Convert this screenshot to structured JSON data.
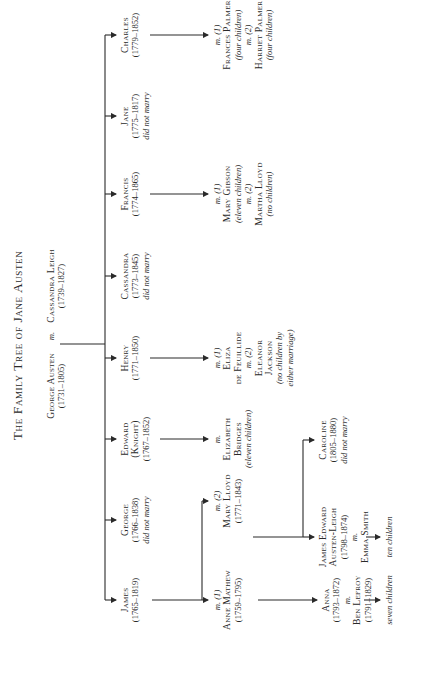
{
  "title": "The Family Tree of Jane Austen",
  "parents": {
    "father": {
      "name": "George Austen",
      "dates": "(1731–1805)"
    },
    "marriage": "m.",
    "mother": {
      "name": "Cassandra Leigh",
      "dates": "(1739–1827)"
    }
  },
  "children": [
    {
      "name": "James",
      "dates": "(1765–1819)"
    },
    {
      "name": "George",
      "dates": "(1766–1838)",
      "note": "did not marry"
    },
    {
      "name": "Edward",
      "name2": "(Knight)",
      "dates": "(1767–1852)"
    },
    {
      "name": "Henry",
      "dates": "(1771–1850)"
    },
    {
      "name": "Cassandra",
      "dates": "(1773–1845)",
      "note": "did not marry"
    },
    {
      "name": "Francis",
      "dates": "(1774–1865)"
    },
    {
      "name": "Jane",
      "dates": "(1775–1817)",
      "note": "did not marry"
    },
    {
      "name": "Charles",
      "dates": "(1779–1852)"
    }
  ],
  "spouses": {
    "james": {
      "m1": "m. (1)",
      "wife1": "Anne Mathew",
      "wife1_dates": "(1759–1795)",
      "m2": "m. (2)",
      "wife2": "Mary Lloyd",
      "wife2_dates": "(1771–1843)"
    },
    "edward": {
      "m": "m.",
      "wife_l1": "Elizabeth",
      "wife_l2": "Bridges",
      "note": "(eleven children)"
    },
    "henry": {
      "m1": "m. (1)",
      "wife1_l1": "Eliza",
      "wife1_l2": "de Feuillide",
      "m2": "m. (2)",
      "wife2_l1": "Eleanor",
      "wife2_l2": "Jackson",
      "note_l1": "(no children by",
      "note_l2": "either marriage)"
    },
    "francis": {
      "m1": "m. (1)",
      "wife1": "Mary Gibson",
      "note1": "(eleven children)",
      "m2": "m. (2)",
      "wife2": "Martha Lloyd",
      "note2": "(no children)"
    },
    "charles": {
      "m1": "m. (1)",
      "wife1": "Frances Palmer",
      "note1": "(four children)",
      "m2": "m. (2)",
      "wife2": "Harriet Palmer",
      "note2": "(four children)"
    }
  },
  "grandchildren": {
    "anna": {
      "name": "Anna",
      "dates": "(1793–1872)",
      "m": "m.",
      "spouse": "Ben Lefroy",
      "spouse_dates": "(1791–1829)",
      "issue": "seven children"
    },
    "james_edward": {
      "name_l1": "James Edward",
      "name_l2": "Austen-Leigh",
      "dates": "(1798–1874)",
      "m": "m.",
      "spouse": "Emma Smith",
      "issue": "ten children"
    },
    "caroline": {
      "name": "Caroline",
      "dates": "(1805–1880)",
      "note": "did not marry"
    }
  }
}
